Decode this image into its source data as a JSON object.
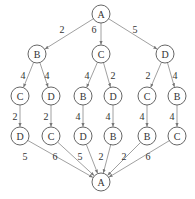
{
  "diagram": {
    "type": "search-tree",
    "node_radius": 9,
    "nodes": [
      {
        "id": "n0",
        "label": "A",
        "x": 101,
        "y": 14
      },
      {
        "id": "n1",
        "label": "B",
        "x": 37,
        "y": 54
      },
      {
        "id": "n2",
        "label": "C",
        "x": 101,
        "y": 54
      },
      {
        "id": "n3",
        "label": "D",
        "x": 165,
        "y": 54
      },
      {
        "id": "n4",
        "label": "C",
        "x": 20,
        "y": 96
      },
      {
        "id": "n5",
        "label": "D",
        "x": 51,
        "y": 96
      },
      {
        "id": "n6",
        "label": "B",
        "x": 83,
        "y": 96
      },
      {
        "id": "n7",
        "label": "D",
        "x": 113,
        "y": 96
      },
      {
        "id": "n8",
        "label": "C",
        "x": 147,
        "y": 96
      },
      {
        "id": "n9",
        "label": "B",
        "x": 177,
        "y": 96
      },
      {
        "id": "n10",
        "label": "D",
        "x": 20,
        "y": 136
      },
      {
        "id": "n11",
        "label": "C",
        "x": 51,
        "y": 136
      },
      {
        "id": "n12",
        "label": "D",
        "x": 83,
        "y": 136
      },
      {
        "id": "n13",
        "label": "B",
        "x": 113,
        "y": 136
      },
      {
        "id": "n14",
        "label": "B",
        "x": 147,
        "y": 136
      },
      {
        "id": "n15",
        "label": "C",
        "x": 177,
        "y": 136
      },
      {
        "id": "n16",
        "label": "A",
        "x": 101,
        "y": 182
      }
    ],
    "edges": [
      {
        "from": "n0",
        "to": "n1",
        "weight": "2",
        "lx": 62,
        "ly": 29
      },
      {
        "from": "n0",
        "to": "n2",
        "weight": "6",
        "lx": 94,
        "ly": 29
      },
      {
        "from": "n0",
        "to": "n3",
        "weight": "5",
        "lx": 135,
        "ly": 29
      },
      {
        "from": "n1",
        "to": "n4",
        "weight": "4",
        "lx": 23,
        "ly": 75
      },
      {
        "from": "n1",
        "to": "n5",
        "weight": "4",
        "lx": 47,
        "ly": 75
      },
      {
        "from": "n2",
        "to": "n6",
        "weight": "4",
        "lx": 87,
        "ly": 75
      },
      {
        "from": "n2",
        "to": "n7",
        "weight": "2",
        "lx": 113,
        "ly": 75
      },
      {
        "from": "n3",
        "to": "n8",
        "weight": "2",
        "lx": 148,
        "ly": 75
      },
      {
        "from": "n3",
        "to": "n9",
        "weight": "4",
        "lx": 175,
        "ly": 75
      },
      {
        "from": "n4",
        "to": "n10",
        "weight": "2",
        "lx": 15,
        "ly": 116
      },
      {
        "from": "n5",
        "to": "n11",
        "weight": "2",
        "lx": 46,
        "ly": 116
      },
      {
        "from": "n6",
        "to": "n12",
        "weight": "4",
        "lx": 78,
        "ly": 116
      },
      {
        "from": "n7",
        "to": "n13",
        "weight": "4",
        "lx": 108,
        "ly": 116
      },
      {
        "from": "n8",
        "to": "n14",
        "weight": "4",
        "lx": 142,
        "ly": 116
      },
      {
        "from": "n9",
        "to": "n15",
        "weight": "4",
        "lx": 172,
        "ly": 116
      },
      {
        "from": "n10",
        "to": "n16",
        "weight": "5",
        "lx": 25,
        "ly": 156
      },
      {
        "from": "n11",
        "to": "n16",
        "weight": "6",
        "lx": 55,
        "ly": 156
      },
      {
        "from": "n12",
        "to": "n16",
        "weight": "5",
        "lx": 80,
        "ly": 156
      },
      {
        "from": "n13",
        "to": "n16",
        "weight": "2",
        "lx": 101,
        "ly": 156
      },
      {
        "from": "n14",
        "to": "n16",
        "weight": "2",
        "lx": 124,
        "ly": 156
      },
      {
        "from": "n15",
        "to": "n16",
        "weight": "6",
        "lx": 148,
        "ly": 156
      }
    ]
  }
}
